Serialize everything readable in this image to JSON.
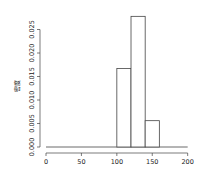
{
  "chart_data": {
    "type": "bar",
    "subtype": "histogram",
    "title": "",
    "xlabel": "",
    "ylabel": "密度",
    "bins": [
      {
        "from": 100,
        "to": 120,
        "density": 0.0167
      },
      {
        "from": 120,
        "to": 140,
        "density": 0.0278
      },
      {
        "from": 140,
        "to": 160,
        "density": 0.0056
      }
    ],
    "categories": [
      "100-120",
      "120-140",
      "140-160"
    ],
    "values": [
      0.0167,
      0.0278,
      0.0056
    ],
    "xlim": [
      0,
      200
    ],
    "ylim": [
      0,
      0.028
    ],
    "x_ticks": [
      0,
      50,
      100,
      150,
      200
    ],
    "y_ticks": [
      "0.000",
      "0.005",
      "0.010",
      "0.015",
      "0.020",
      "0.025"
    ],
    "baseline_range": [
      0,
      200
    ],
    "grid": false,
    "legend": null
  }
}
